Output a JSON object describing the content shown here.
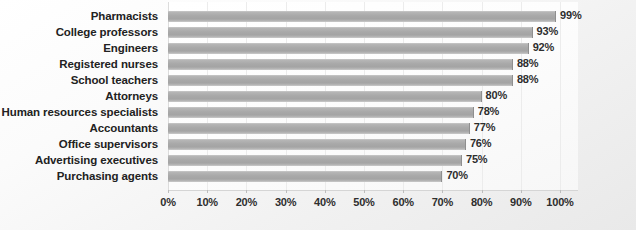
{
  "chart_data": {
    "type": "bar",
    "orientation": "horizontal",
    "title": "",
    "xlabel": "",
    "ylabel": "",
    "xlim": [
      0,
      100
    ],
    "xticks": [
      "0%",
      "10%",
      "20%",
      "30%",
      "40%",
      "50%",
      "60%",
      "70%",
      "80%",
      "90%",
      "100%"
    ],
    "xtick_values": [
      0,
      10,
      20,
      30,
      40,
      50,
      60,
      70,
      80,
      90,
      100
    ],
    "grid": true,
    "legend": false,
    "categories": [
      "Pharmacists",
      "College professors",
      "Engineers",
      "Registered nurses",
      "School teachers",
      "Attorneys",
      "Human resources specialists",
      "Accountants",
      "Office supervisors",
      "Advertising executives",
      "Purchasing agents"
    ],
    "values": [
      99,
      93,
      92,
      88,
      88,
      80,
      78,
      77,
      76,
      75,
      70
    ],
    "value_labels": [
      "99%",
      "93%",
      "92%",
      "88%",
      "88%",
      "80%",
      "78%",
      "77%",
      "76%",
      "75%",
      "70%"
    ],
    "bar_color": "#a8a8a8",
    "plot_background": "#fdfdfd",
    "chart_background": "#f1f1f1",
    "text_color": "#222222"
  }
}
